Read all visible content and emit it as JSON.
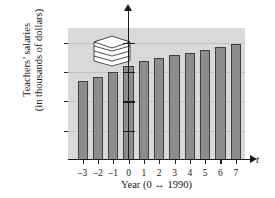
{
  "chart_data": {
    "type": "bar",
    "title": "",
    "subtitle": "",
    "xlabel": "Year (0 ↔ 1990)",
    "ylabel": "Teachers' salaries (in thousands of dollars)",
    "ylabel_line1": "Teachers’ salaries",
    "ylabel_line2": "(in thousands of dollars)",
    "x_axis_symbol": "t",
    "y_axis_symbol": "S",
    "categories": [
      "-3",
      "-2",
      "-1",
      "0",
      "1",
      "2",
      "3",
      "4",
      "5",
      "6",
      "7"
    ],
    "x": [
      -3,
      -2,
      -1,
      0,
      1,
      2,
      3,
      4,
      5,
      6,
      7
    ],
    "values": [
      26.8,
      28.3,
      30.1,
      32.0,
      33.7,
      34.8,
      35.7,
      36.4,
      37.5,
      38.6,
      39.6
    ],
    "xtick_labels": [
      "–3",
      "–2",
      "–1",
      "0",
      "1",
      "2",
      "3",
      "4",
      "5",
      "6",
      "7"
    ],
    "ytick_labels": [
      "10",
      "20",
      "30",
      "40"
    ],
    "yticks": [
      10,
      20,
      30,
      40
    ],
    "ylim": [
      0,
      45
    ],
    "xlim": [
      -3.8,
      7.8
    ],
    "grid": true,
    "legend": "none",
    "annotations": [
      "stacked-layers decorative icon in upper-left of plot area"
    ]
  },
  "axes": {
    "y_symbol": "S",
    "x_symbol": "t",
    "caption": "Year (0 ↔ 1990)",
    "ylabel_line1": "Teachers’ salaries",
    "ylabel_line2": "(in thousands of dollars)"
  },
  "colors": {
    "plot_background": "#d9d9d9",
    "bar_fill": "#8d8d8d",
    "bar_stroke": "#3f3f3f",
    "gridline": "#c2c2c2",
    "axis": "#1a1a1a",
    "text": "#171717",
    "page_background": "#ffffff"
  },
  "icon": {
    "name": "stacked-layers-icon",
    "layers": 5
  }
}
